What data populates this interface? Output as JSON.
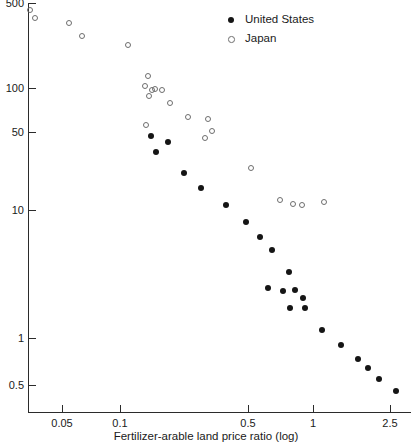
{
  "chart_data": {
    "type": "scatter",
    "title": "",
    "xlabel": "Fertilizer-arable land price ratio (log)",
    "ylabel": "",
    "xscale": "log",
    "yscale": "log",
    "xlim": [
      0.028,
      3.1
    ],
    "ylim": [
      0.38,
      560
    ],
    "grid": false,
    "legend_position": "top-right",
    "xticks": [
      {
        "value": 0.05,
        "label": "0.05",
        "px": 62
      },
      {
        "value": 0.1,
        "label": "0.1",
        "px": 120
      },
      {
        "value": 0.5,
        "label": "0.5",
        "px": 248
      },
      {
        "value": 1,
        "label": "1",
        "px": 313
      },
      {
        "value": 2.5,
        "label": "2.5",
        "px": 390
      }
    ],
    "yticks": [
      {
        "value": 500,
        "label": "500",
        "px": 3
      },
      {
        "value": 100,
        "label": "100",
        "px": 88
      },
      {
        "value": 50,
        "label": "50",
        "px": 132
      },
      {
        "value": 10,
        "label": "10",
        "px": 210
      },
      {
        "value": 1,
        "label": "1",
        "px": 338
      },
      {
        "value": 0.5,
        "label": "0.5",
        "px": 385
      }
    ],
    "series": [
      {
        "name": "United States",
        "marker": "filled-circle",
        "color": "#151515",
        "points": [
          {
            "x": 0.133,
            "y": 50.0,
            "px": 151,
            "py": 136
          },
          {
            "x": 0.143,
            "y": 37.0,
            "px": 156,
            "py": 152
          },
          {
            "x": 0.16,
            "y": 44.5,
            "px": 168,
            "py": 142
          },
          {
            "x": 0.196,
            "y": 24.0,
            "px": 184,
            "py": 173
          },
          {
            "x": 0.245,
            "y": 17.5,
            "px": 201,
            "py": 188
          },
          {
            "x": 0.335,
            "y": 12.5,
            "px": 226,
            "py": 205
          },
          {
            "x": 0.47,
            "y": 8.8,
            "px": 246,
            "py": 222
          },
          {
            "x": 0.59,
            "y": 6.2,
            "px": 260,
            "py": 237
          },
          {
            "x": 0.7,
            "y": 4.6,
            "px": 272,
            "py": 250
          },
          {
            "x": 0.81,
            "y": 3.1,
            "px": 289,
            "py": 272
          },
          {
            "x": 0.84,
            "y": 2.4,
            "px": 268,
            "py": 288
          },
          {
            "x": 0.88,
            "y": 2.3,
            "px": 283,
            "py": 291
          },
          {
            "x": 0.9,
            "y": 2.3,
            "px": 295,
            "py": 290
          },
          {
            "x": 0.94,
            "y": 2.0,
            "px": 303,
            "py": 298
          },
          {
            "x": 0.96,
            "y": 1.7,
            "px": 290,
            "py": 308
          },
          {
            "x": 1.0,
            "y": 1.7,
            "px": 305,
            "py": 308
          },
          {
            "x": 1.08,
            "y": 1.2,
            "px": 322,
            "py": 330
          },
          {
            "x": 1.35,
            "y": 0.92,
            "px": 341,
            "py": 345
          },
          {
            "x": 1.65,
            "y": 0.72,
            "px": 358,
            "py": 359
          },
          {
            "x": 1.95,
            "y": 0.62,
            "px": 368,
            "py": 368
          },
          {
            "x": 2.3,
            "y": 0.5,
            "px": 379,
            "py": 379
          },
          {
            "x": 2.75,
            "y": 0.4,
            "px": 396,
            "py": 391
          }
        ]
      },
      {
        "name": "Japan",
        "marker": "open-circle",
        "color": "#6e6e6e",
        "points": [
          {
            "x": 0.034,
            "y": 430,
            "px": 30,
            "py": 10
          },
          {
            "x": 0.037,
            "y": 380,
            "px": 35,
            "py": 18
          },
          {
            "x": 0.06,
            "y": 340,
            "px": 69,
            "py": 23
          },
          {
            "x": 0.072,
            "y": 285,
            "px": 82,
            "py": 36
          },
          {
            "x": 0.108,
            "y": 225,
            "px": 128,
            "py": 45
          },
          {
            "x": 0.14,
            "y": 130,
            "px": 148,
            "py": 76
          },
          {
            "x": 0.145,
            "y": 105,
            "px": 145,
            "py": 86
          },
          {
            "x": 0.148,
            "y": 99,
            "px": 152,
            "py": 90
          },
          {
            "x": 0.155,
            "y": 100,
            "px": 155,
            "py": 89
          },
          {
            "x": 0.162,
            "y": 96,
            "px": 162,
            "py": 90
          },
          {
            "x": 0.15,
            "y": 84,
            "px": 149,
            "py": 96
          },
          {
            "x": 0.19,
            "y": 72,
            "px": 170,
            "py": 103
          },
          {
            "x": 0.24,
            "y": 68,
            "px": 188,
            "py": 117
          },
          {
            "x": 0.14,
            "y": 56,
            "px": 146,
            "py": 125
          },
          {
            "x": 0.28,
            "y": 52,
            "px": 208,
            "py": 119
          },
          {
            "x": 0.3,
            "y": 44,
            "px": 212,
            "py": 131
          },
          {
            "x": 0.3,
            "y": 42,
            "px": 205,
            "py": 138
          },
          {
            "x": 0.52,
            "y": 22,
            "px": 251,
            "py": 168
          },
          {
            "x": 0.76,
            "y": 13.5,
            "px": 280,
            "py": 200
          },
          {
            "x": 0.83,
            "y": 12.5,
            "px": 293,
            "py": 204
          },
          {
            "x": 0.88,
            "y": 12.5,
            "px": 302,
            "py": 205
          },
          {
            "x": 1.08,
            "y": 13.0,
            "px": 324,
            "py": 202
          }
        ]
      }
    ]
  },
  "legend": {
    "entries": [
      {
        "label": "United States",
        "marker": "filled-circle"
      },
      {
        "label": "Japan",
        "marker": "open-circle"
      }
    ]
  },
  "axes": {
    "x_title": "Fertilizer-arable land price ratio (log)"
  }
}
